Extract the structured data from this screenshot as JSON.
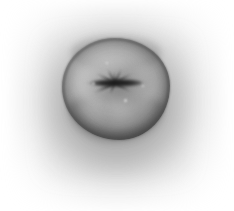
{
  "image": {
    "title": "Grayscale photograph of a fruit",
    "subject": "apple",
    "view": "calyx end, top-down",
    "color_mode": "grayscale",
    "background_label": "white studio background",
    "alt_text": "Black and white photo of an apple viewed from the calyx end, centered on a white background with a soft gray shadow halo",
    "dimensions": {
      "width": 234,
      "height": 211
    }
  },
  "palette": {
    "background": "#ffffff",
    "halo": "#8c8c8c",
    "fruit_highlight": "#c2c2c2",
    "fruit_midtone": "#9a9a9a",
    "fruit_shadow": "#5a5a5a",
    "rim": "#4b4b4b",
    "calyx_dark": "#1e1e1e"
  },
  "parts": {
    "halo_label": "soft shadow halo",
    "body_label": "fruit body",
    "rim_label": "fruit outline rim",
    "basin_label": "calyx basin depression",
    "slit_label": "calyx slit",
    "ray_label": "calyx radiating ray",
    "highlight_label": "specular highlight",
    "bottom_shade_label": "lower shadow crescent",
    "top_shade_label": "upper shoulder shading"
  },
  "geometry": {
    "fruit_center": {
      "x": 116,
      "y": 89
    },
    "fruit_width": 108,
    "fruit_height": 102,
    "calyx_center": {
      "x": 114,
      "y": 89
    },
    "rays": [
      {
        "angle": 180,
        "length": 30,
        "thickness": 3.4
      },
      {
        "angle": 0,
        "length": 32,
        "thickness": 3.6
      },
      {
        "angle": 206,
        "length": 24,
        "thickness": 2.6
      },
      {
        "angle": 152,
        "length": 22,
        "thickness": 2.4
      },
      {
        "angle": 118,
        "length": 17,
        "thickness": 2.2
      },
      {
        "angle": 66,
        "length": 16,
        "thickness": 2.0
      },
      {
        "angle": 28,
        "length": 20,
        "thickness": 2.4
      },
      {
        "angle": 330,
        "length": 19,
        "thickness": 2.2
      },
      {
        "angle": 246,
        "length": 13,
        "thickness": 1.8
      },
      {
        "angle": 96,
        "length": 12,
        "thickness": 1.8
      }
    ],
    "specks": [
      {
        "x": 30,
        "y": 44,
        "size": 3.0
      },
      {
        "x": 62,
        "y": 61,
        "size": 3.4
      },
      {
        "x": 44,
        "y": 24,
        "size": 2.4
      },
      {
        "x": 80,
        "y": 47,
        "size": 2.2
      }
    ]
  }
}
